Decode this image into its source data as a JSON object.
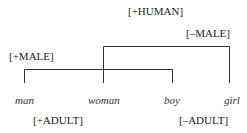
{
  "features": {
    "human": "[+HUMAN]",
    "not_male": "[–MALE]",
    "male": "[+MALE]",
    "adult": "[+ADULT]",
    "not_adult": "[–ADULT]"
  },
  "words": [
    "man",
    "woman",
    "boy",
    "girl"
  ],
  "colors": {
    "line": "#333333",
    "text": "#222222"
  }
}
